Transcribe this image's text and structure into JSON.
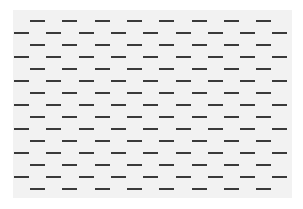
{
  "pattern": {
    "panel": {
      "left": 13,
      "top": 10,
      "width": 279,
      "height": 188,
      "background": "#f2f2f2"
    },
    "dash": {
      "width": 15,
      "height": 2,
      "color": "#3a3a3a"
    },
    "page_background": "#ffffff",
    "row_spacing": 12,
    "first_row_y": 20,
    "row_count": 15,
    "column_period": 32.3,
    "offset_rows": {
      "start_x": 30,
      "count": 8
    },
    "edge_rows": {
      "start_x": 14,
      "count": 9
    }
  }
}
